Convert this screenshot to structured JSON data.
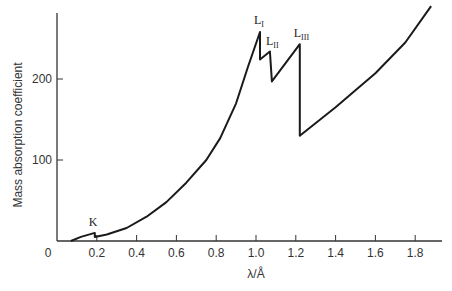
{
  "chart_data": {
    "type": "line",
    "title": "",
    "xlabel": "λ/Å",
    "ylabel": "Mass absorption coefficient",
    "xlim": [
      0,
      1.92
    ],
    "ylim": [
      0,
      285
    ],
    "grid": false,
    "legend": null,
    "x_ticks": [
      "0",
      "0.2",
      "0.4",
      "0.6",
      "0.8",
      "1.0",
      "1.2",
      "1.4",
      "1.6",
      "1.8"
    ],
    "y_ticks": [
      "100",
      "200"
    ],
    "series": [
      {
        "name": "absorption",
        "points": [
          [
            0.07,
            0
          ],
          [
            0.12,
            5
          ],
          [
            0.19,
            10
          ],
          [
            0.19,
            5
          ],
          [
            0.25,
            8
          ],
          [
            0.35,
            16
          ],
          [
            0.45,
            30
          ],
          [
            0.55,
            48
          ],
          [
            0.65,
            72
          ],
          [
            0.75,
            100
          ],
          [
            0.82,
            127
          ],
          [
            0.9,
            170
          ],
          [
            0.96,
            215
          ],
          [
            1.02,
            258
          ],
          [
            1.02,
            224
          ],
          [
            1.07,
            234
          ],
          [
            1.08,
            197
          ],
          [
            1.22,
            243
          ],
          [
            1.22,
            130
          ],
          [
            1.4,
            165
          ],
          [
            1.6,
            207
          ],
          [
            1.75,
            245
          ],
          [
            1.88,
            290
          ]
        ]
      }
    ],
    "annotations": [
      {
        "text": "K",
        "sub": "",
        "x": 0.19,
        "y": 18
      },
      {
        "text": "L",
        "sub": "I",
        "x": 1.02,
        "y": 268
      },
      {
        "text": "L",
        "sub": "II",
        "x": 1.08,
        "y": 242
      },
      {
        "text": "L",
        "sub": "III",
        "x": 1.22,
        "y": 252
      }
    ]
  },
  "labels": {
    "origin": "0",
    "k": "K",
    "l": "L",
    "l1_sub": "I",
    "l2_sub": "II",
    "l3_sub": "III"
  }
}
